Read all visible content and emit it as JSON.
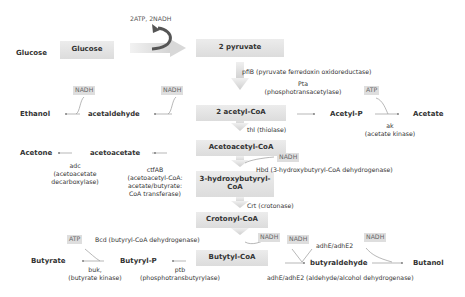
{
  "glycolysis": {
    "energy_label": "2ATP, 2NADH",
    "glucose_label": "Glucose",
    "glucose_box": "Glucose",
    "pyruvate_box": "2 pyruvate"
  },
  "central_path": {
    "acetyl_coa": "2 acetyl-CoA",
    "acetoacetyl_coa": "Acetoacetyl-CoA",
    "hydroxybutyryl_coa": "3-hydroxybutyryl-CoA",
    "crotonyl_coa": "Crotonyl-CoA",
    "butyryl_coa": "Butytyl-CoA"
  },
  "enzymes": {
    "pfib": "pfiB (pyruvate ferredoxin oxidoreductase)",
    "pta_1": "Pta",
    "pta_2": "(phosphotransacetylase)",
    "ak_1": "ak",
    "ak_2": "(acetate kinase)",
    "thl": "thl (thiolase)",
    "hbd": "Hbd (3-hydroxybutyryl-CoA dehydrogenase)",
    "crt": "Crt (crotonase)",
    "bcd": "Bcd (butyryl-CoA dehydrogenase)",
    "adc_1": "adc",
    "adc_2": "(acetoacetate",
    "adc_3": "decarboxylase)",
    "ctfab_1": "ctfAB",
    "ctfab_2": "(acetoacetyl-CoA:",
    "ctfab_3": "acetate/butyrate:",
    "ctfab_4": "CoA transferase)",
    "buk_1": "buk,",
    "buk_2": "(butyrate kinase)",
    "ptb_1": "ptb",
    "ptb_2": "(phosphotransbutyrylase)",
    "adhe_top": "adhE/adhE2",
    "adhe_bottom": "adhE/adhE2 (aldehyde/alcohol dehydrogenase)"
  },
  "metabolites": {
    "ethanol": "Ethanol",
    "acetaldehyde": "acetaldehyde",
    "acetyl_p": "Acetyl-P",
    "acetate": "Acetate",
    "acetone": "Acetone",
    "acetoacetate": "acetoacetate",
    "butyrate": "Butyrate",
    "butyryl_p": "Butyryl-P",
    "butyraldehyde": "butyraldehyde",
    "butanol": "Butanol"
  },
  "cofactors": {
    "nadh_ethanol": "NADH",
    "nadh_acetaldehyde": "NADH",
    "atp_acetate": "ATP",
    "nadh_hbd": "NADH",
    "atp_butyrate": "ATP",
    "nadh_bcd": "NADH",
    "nadh_butyraldehyde": "NADH",
    "nadh_butanol": "NADH"
  }
}
